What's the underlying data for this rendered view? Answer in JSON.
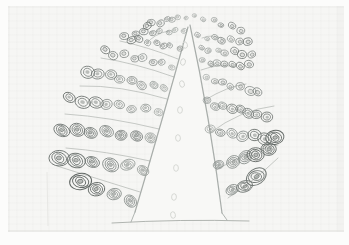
{
  "scene": {
    "kind": "photographed pencil sketch",
    "subject": "hand-drawn botanical diagram: tall pale cone (shoot apex / trunk) flanked by fans of oval cell-like bodies that enlarge outward, separated by thin curved branch lines",
    "visible_text": ""
  },
  "palette": {
    "photo_margin": "#fcfcfb",
    "paper": "#f6f6f4",
    "paper_edge": "#e2e2df",
    "crease": "#e8e8e5",
    "shade": "rgba(70,70,64,0.025)",
    "cone_fill": "#f8f8f6",
    "cone_stroke": "#9aa09c",
    "base_stroke": "#a9ada9",
    "line_stroke": "#b5b9b5",
    "dot_stroke": "#d3d5d1",
    "cell_shades": [
      "#9aa09c",
      "#868c89",
      "#737976",
      "#626865"
    ],
    "cell_fill": "rgba(105,111,108,0.16)",
    "cell_core_fill": "rgba(90,96,93,0.38)"
  },
  "canvas": {
    "width": 349,
    "height": 245
  },
  "paper": {
    "sheet": {
      "x": 8,
      "y": 6,
      "w": 336,
      "h": 226
    },
    "bottom_edge": {
      "x1": 8,
      "y1": 231,
      "x2": 344,
      "y2": 231
    },
    "top_edge": {
      "x1": 8,
      "y1": 7,
      "x2": 344,
      "y2": 7
    },
    "left_edge": {
      "x1": 9,
      "y1": 6,
      "x2": 9,
      "y2": 232
    },
    "right_shade": {
      "x": 337,
      "y": 6,
      "w": 7,
      "h": 226
    },
    "crease": {
      "x1": 47,
      "y1": 172,
      "x2": 48,
      "y2": 226
    }
  },
  "drawing": {
    "cone": {
      "fill_path": "M189,25 Q163,118 135,212 L131,222 Q180,218 227,221 L222,213 Q210,118 191,25 Z",
      "left_edge": "M188,27 Q163,118 135,212",
      "right_edge": "M190,25 Q210,118 222,213",
      "left_foot": "M135,212 L131,222",
      "right_foot": "M222,213 L227,220",
      "base": "M112,223 Q180,219 249,221"
    },
    "center_dots": [
      [
        185,
        45
      ],
      [
        183,
        62
      ],
      [
        182,
        84
      ],
      [
        180,
        110
      ],
      [
        178,
        138
      ],
      [
        176,
        168
      ],
      [
        174,
        197
      ],
      [
        173,
        215
      ]
    ],
    "branch_lines": {
      "left": [
        "M168,31 Q154,34 146,44",
        "M178,59 Q148,47 120,41",
        "M174,77 Q135,63 101,58",
        "M167,99 Q120,85 80,86",
        "M159,129 Q110,117 65,114",
        "M150,161 Q105,151 66,148",
        "M140,192 Q95,178 57,166"
      ],
      "right": [
        "M202,38 Q214,33 224,40",
        "M201,70 Q220,63 235,67",
        "M205,100 Q228,86 246,84",
        "M210,133 Q240,110 274,106",
        "M216,170 Q250,150 278,145",
        "M228,198 Q254,181 278,158"
      ]
    },
    "cell_rows": {
      "left": [
        {
          "inner": [
            186,
            16
          ],
          "outer": [
            146,
            25
          ],
          "n": 7,
          "a": 3.1,
          "b": 2.5,
          "style": "ring"
        },
        {
          "inner": [
            183,
            30
          ],
          "outer": [
            137,
            33
          ],
          "n": 7,
          "a": 3.3,
          "b": 2.7,
          "style": "ring"
        },
        {
          "inner": [
            179,
            47
          ],
          "outer": [
            124,
            38
          ],
          "n": 8,
          "a": 3.5,
          "b": 2.9,
          "style": "ring"
        },
        {
          "inner": [
            172,
            66
          ],
          "outer": [
            105,
            52
          ],
          "n": 8,
          "a": 4.1,
          "b": 3.4,
          "style": "ring"
        },
        {
          "inner": [
            165,
            88
          ],
          "outer": [
            87,
            72
          ],
          "n": 8,
          "a": 4.9,
          "b": 4.0,
          "style": "double"
        },
        {
          "inner": [
            158,
            111
          ],
          "outer": [
            70,
            99
          ],
          "n": 8,
          "a": 5.8,
          "b": 4.6,
          "style": "double"
        },
        {
          "inner": [
            151,
            138
          ],
          "outer": [
            62,
            129
          ],
          "n": 7,
          "a": 6.6,
          "b": 5.2,
          "style": "spiral"
        },
        {
          "inner": [
            143,
            169
          ],
          "outer": [
            60,
            158
          ],
          "n": 6,
          "a": 7.4,
          "b": 5.8,
          "style": "spiral"
        },
        {
          "inner": [
            132,
            199
          ],
          "outer": [
            80,
            184
          ],
          "n": 4,
          "a": 8.2,
          "b": 6.2,
          "style": "spiral"
        }
      ],
      "right": [
        {
          "inner": [
            195,
            16
          ],
          "outer": [
            240,
            29
          ],
          "n": 6,
          "a": 3.1,
          "b": 2.5,
          "style": "ring"
        },
        {
          "inner": [
            198,
            36
          ],
          "outer": [
            247,
            42
          ],
          "n": 7,
          "a": 3.3,
          "b": 2.7,
          "style": "ring"
        },
        {
          "inner": [
            200,
            48
          ],
          "outer": [
            252,
            55
          ],
          "n": 7,
          "a": 3.5,
          "b": 2.9,
          "style": "ring"
        },
        {
          "inner": [
            202,
            62
          ],
          "outer": [
            249,
            66
          ],
          "n": 7,
          "a": 3.7,
          "b": 3.1,
          "style": "ring"
        },
        {
          "inner": [
            205,
            77
          ],
          "outer": [
            258,
            93
          ],
          "n": 7,
          "a": 4.2,
          "b": 3.5,
          "style": "ring"
        },
        {
          "inner": [
            207,
            102
          ],
          "outer": [
            266,
            117
          ],
          "n": 8,
          "a": 4.9,
          "b": 4.0,
          "style": "double"
        },
        {
          "inner": [
            211,
            131
          ],
          "outer": [
            276,
            139
          ],
          "n": 7,
          "a": 5.8,
          "b": 4.6,
          "style": "double",
          "accent_last": true
        },
        {
          "inner": [
            220,
            165
          ],
          "outer": [
            268,
            150
          ],
          "n": 5,
          "a": 6.8,
          "b": 5.4,
          "style": "spiral"
        },
        {
          "inner": [
            234,
            190
          ],
          "outer": [
            256,
            179
          ],
          "n": 3,
          "a": 7.6,
          "b": 5.8,
          "style": "spiral"
        }
      ]
    }
  }
}
